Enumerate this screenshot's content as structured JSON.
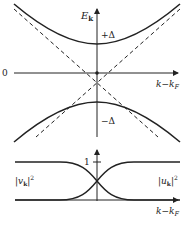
{
  "diagram": {
    "top_panel": {
      "y_axis_label": "E",
      "y_axis_subscript": "k",
      "x_axis_label": "k−k",
      "x_axis_subscript": "F",
      "origin_label": "0",
      "gap_plus_label": "+Δ",
      "gap_minus_label": "−Δ",
      "curves": [
        "upper branch +E_k (gapped)",
        "lower branch −E_k (gapped)",
        "dashed normal-state dispersion ±ξ_k"
      ]
    },
    "bottom_panel": {
      "tick_label": "1",
      "left_curve_label_pre": "|",
      "left_curve_symbol": "v",
      "left_curve_subscript": "k",
      "left_curve_power": "2",
      "right_curve_symbol": "u",
      "right_curve_subscript": "k",
      "right_curve_power": "2",
      "x_axis_label": "k−k",
      "x_axis_subscript": "F"
    },
    "colors": {
      "line": "#222222",
      "background": "#ffffff"
    }
  }
}
